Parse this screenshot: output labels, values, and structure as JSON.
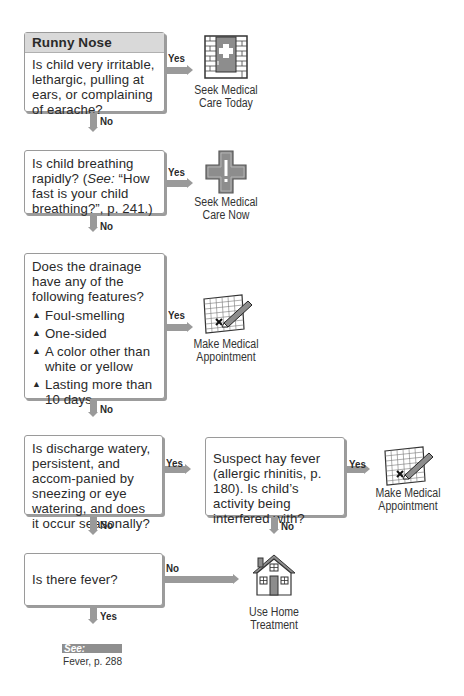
{
  "title": "Runny Nose",
  "nodes": [
    {
      "id": "q1",
      "question": "Is child very irritable, lethargic, pulling at ears, or complaining of earache?",
      "yes_label": "Yes",
      "no_label": "No",
      "yes_outcome": {
        "icon": "doctor-office-door-icon",
        "caption_line1": "Seek Medical",
        "caption_line2": "Care Today"
      }
    },
    {
      "id": "q2",
      "question_prefix": "Is child breathing rapidly? (",
      "question_see": "See:",
      "question_suffix": " “How fast is your child breathing?”, p. 241.)",
      "yes_label": "Yes",
      "no_label": "No",
      "yes_outcome": {
        "icon": "emergency-cross-icon",
        "caption_line1": "Seek Medical",
        "caption_line2": "Care Now"
      }
    },
    {
      "id": "q3",
      "question": "Does the drainage have any of the following features?",
      "bullets": [
        "Foul-smelling",
        "One-sided",
        "A color other than white or yellow",
        "Lasting more than 10 days"
      ],
      "yes_label": "Yes",
      "no_label": "No",
      "yes_outcome": {
        "icon": "calendar-appointment-icon",
        "caption_line1": "Make Medical",
        "caption_line2": "Appointment"
      }
    },
    {
      "id": "q4",
      "question": "Is discharge watery, persistent, and accom-panied by sneezing or eye watering, and does it occur seasonally?",
      "yes_label": "Yes",
      "no_label": "No"
    },
    {
      "id": "q5",
      "question": "Suspect hay fever (allergic rhinitis, p. 180). Is child’s activity being interfered with?",
      "yes_label": "Yes",
      "no_label": "No",
      "yes_outcome": {
        "icon": "calendar-appointment-icon",
        "caption_line1": "Make Medical",
        "caption_line2": "Appointment"
      }
    },
    {
      "id": "q6",
      "question": "Is there fever?",
      "yes_label": "Yes",
      "no_label": "No",
      "no_outcome": {
        "icon": "home-icon",
        "caption_line1": "Use Home",
        "caption_line2": "Treatment"
      },
      "yes_reference": {
        "see_label": "See:",
        "reference": "Fever, p. 288"
      }
    }
  ]
}
